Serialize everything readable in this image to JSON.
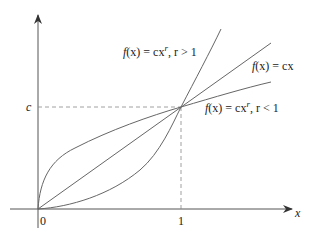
{
  "diagram": {
    "axes": {
      "x_label": "x",
      "origin_label": "0",
      "x_tick_label": "1",
      "y_tick_label": "c"
    },
    "curves": [
      {
        "id": "power-gt1",
        "label_f": "f",
        "label_x": "(x) = cx",
        "label_exp": "r",
        "label_cond": ",  r > 1"
      },
      {
        "id": "linear",
        "label_f": "f",
        "label_x": "(x) = cx"
      },
      {
        "id": "power-lt1",
        "label_f": "f",
        "label_x": "(x) = cx",
        "label_exp": "r",
        "label_cond": ",  r < 1"
      }
    ],
    "colors": {
      "axis": "#555555",
      "curve": "#666666",
      "dash": "#888888",
      "text": "#222222"
    }
  }
}
